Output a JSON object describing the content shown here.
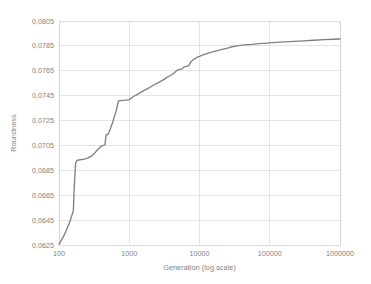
{
  "chart_data": {
    "type": "line",
    "title": "",
    "xlabel": "Generation (log scale)",
    "ylabel": "Roundness",
    "xscale": "log",
    "xlim": [
      100,
      1000000
    ],
    "ylim": [
      0.0625,
      0.0805
    ],
    "grid": true,
    "legend": false,
    "legend_position": "none",
    "decimal_separator": ",",
    "x_tick_labels": [
      "100",
      "1000",
      "10000",
      "100000",
      "1000000"
    ],
    "x_tick_values": [
      100,
      1000,
      10000,
      100000,
      1000000
    ],
    "y_tick_labels": [
      "0,0625",
      "0,0645",
      "0,0665",
      "0,0685",
      "0,0705",
      "0,0725",
      "0,0745",
      "0,0765",
      "0,0785",
      "0,0805"
    ],
    "y_tick_values": [
      0.0625,
      0.0645,
      0.0665,
      0.0685,
      0.0705,
      0.0725,
      0.0745,
      0.0765,
      0.0785,
      0.0805
    ],
    "series": [
      {
        "name": "Roundness",
        "color": "#808080",
        "x": [
          100,
          120,
          140,
          150,
          160,
          165,
          172,
          180,
          200,
          230,
          260,
          300,
          330,
          360,
          400,
          430,
          450,
          470,
          500,
          540,
          580,
          620,
          660,
          700,
          760,
          820,
          900,
          1000,
          1100,
          1250,
          1400,
          1600,
          1800,
          2000,
          2300,
          2600,
          3000,
          3400,
          3800,
          4300,
          4800,
          5200,
          5600,
          6000,
          6500,
          7000,
          7600,
          8200,
          9000,
          10000,
          11000,
          13000,
          15000,
          18000,
          21000,
          25000,
          30000,
          36000,
          44000,
          55000,
          70000,
          90000,
          120000,
          160000,
          220000,
          300000,
          420000,
          600000,
          800000,
          1000000
        ],
        "y": [
          0.06255,
          0.06335,
          0.06425,
          0.06475,
          0.06525,
          0.0672,
          0.06905,
          0.0693,
          0.06935,
          0.0694,
          0.0695,
          0.0697,
          0.06995,
          0.0702,
          0.07045,
          0.0705,
          0.07055,
          0.07135,
          0.0714,
          0.07185,
          0.07235,
          0.0729,
          0.0734,
          0.07408,
          0.0741,
          0.07412,
          0.07414,
          0.07418,
          0.07435,
          0.07455,
          0.0747,
          0.0749,
          0.07505,
          0.0752,
          0.0754,
          0.07555,
          0.07575,
          0.07595,
          0.0761,
          0.0763,
          0.07655,
          0.0766,
          0.07665,
          0.0768,
          0.07685,
          0.0769,
          0.07725,
          0.0774,
          0.07755,
          0.07765,
          0.07775,
          0.0779,
          0.078,
          0.07812,
          0.07822,
          0.07832,
          0.07845,
          0.07852,
          0.07858,
          0.07862,
          0.07868,
          0.07872,
          0.07878,
          0.07882,
          0.07886,
          0.0789,
          0.07895,
          0.079,
          0.07903,
          0.07905
        ]
      }
    ]
  }
}
